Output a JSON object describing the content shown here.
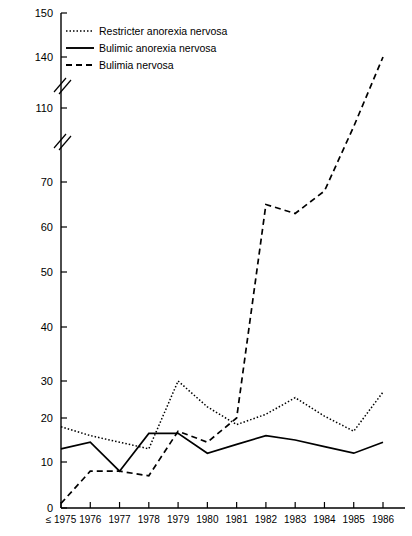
{
  "chart_data": {
    "type": "line",
    "title": "",
    "subtitle": "",
    "xlabel": "",
    "ylabel": "",
    "grid": false,
    "legend_position": "top-left",
    "x": [
      "≤ 1975",
      "1976",
      "1977",
      "1978",
      "1979",
      "1980",
      "1981",
      "1982",
      "1983",
      "1984",
      "1985",
      "1986"
    ],
    "categories": [
      "≤ 1975",
      "1976",
      "1977",
      "1978",
      "1979",
      "1980",
      "1981",
      "1982",
      "1983",
      "1984",
      "1985",
      "1986"
    ],
    "y_tick_labels": [
      "150",
      "140",
      "110",
      "70",
      "60",
      "50",
      "40",
      "30",
      "20",
      "10",
      "0"
    ],
    "y_tick_values": [
      150,
      140,
      110,
      70,
      60,
      50,
      40,
      30,
      20,
      10,
      0
    ],
    "ylim": [
      0,
      150
    ],
    "axis_breaks": [
      [
        110,
        140
      ],
      [
        70,
        110
      ]
    ],
    "series": [
      {
        "name": "Restricter anorexia nervosa",
        "style": "dotted",
        "values": [
          18,
          16,
          14.5,
          13,
          30,
          23,
          18.5,
          21,
          25.5,
          20.5,
          17,
          27
        ]
      },
      {
        "name": "Bulimic anorexia nervosa",
        "style": "solid",
        "values": [
          13,
          14.5,
          8,
          16.5,
          16.5,
          12,
          14,
          16,
          15,
          13.5,
          12,
          14.5
        ]
      },
      {
        "name": "Bulimia nervosa",
        "style": "dashed",
        "values": [
          1,
          8,
          8,
          7,
          17,
          14.5,
          20,
          65,
          63,
          68,
          100,
          140
        ]
      }
    ]
  },
  "legend": {
    "items": [
      {
        "label": "Restricter anorexia nervosa",
        "style": "dotted"
      },
      {
        "label": "Bulimic anorexia nervosa",
        "style": "solid"
      },
      {
        "label": "Bulimia nervosa",
        "style": "dashed"
      }
    ]
  },
  "axis": {
    "x_first_label": "≤ 1975"
  }
}
